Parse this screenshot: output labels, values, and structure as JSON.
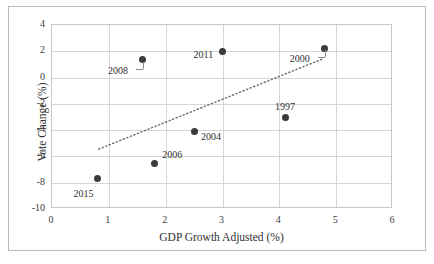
{
  "chart_data": {
    "type": "scatter",
    "title": "",
    "xlabel": "GDP Growth Adjusted (%)",
    "ylabel": "Vote Change (%)",
    "xlim": [
      0,
      6
    ],
    "ylim": [
      -10,
      4
    ],
    "xticks": [
      "0",
      "1",
      "2",
      "3",
      "4",
      "5",
      "6"
    ],
    "yticks": [
      "4",
      "2",
      "0",
      "-2",
      "-4",
      "-6",
      "-8",
      "-10"
    ],
    "grid": true,
    "legend": "none",
    "marker_color": "#3b3b3b",
    "trendline": {
      "style": "dotted",
      "color": "#6b6b6b",
      "x_start": 0.82,
      "y_start": -5.45,
      "x_end": 4.78,
      "y_end": 1.45
    },
    "points": [
      {
        "label": "2015",
        "x": 0.8,
        "y": -7.7,
        "label_pos": "below-left"
      },
      {
        "label": "2008",
        "x": 1.6,
        "y": 1.35,
        "label_pos": "leader-left"
      },
      {
        "label": "2006",
        "x": 1.8,
        "y": -6.55,
        "label_pos": "above-right"
      },
      {
        "label": "2004",
        "x": 2.5,
        "y": -4.1,
        "label_pos": "below-right"
      },
      {
        "label": "2011",
        "x": 3.0,
        "y": 1.95,
        "label_pos": "left"
      },
      {
        "label": "1997",
        "x": 4.1,
        "y": -3.0,
        "label_pos": "above"
      },
      {
        "label": "2000",
        "x": 4.8,
        "y": 2.25,
        "label_pos": "leader-left"
      }
    ]
  }
}
